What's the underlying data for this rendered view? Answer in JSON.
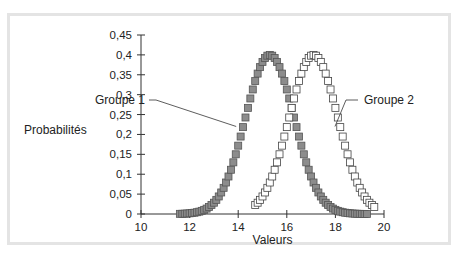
{
  "chart_data": {
    "type": "scatter",
    "title": "",
    "xlabel": "Valeurs",
    "ylabel": "Probabilités",
    "xlim": [
      10,
      20
    ],
    "ylim": [
      0,
      0.45
    ],
    "x_ticks": [
      "10",
      "12",
      "14",
      "16",
      "18",
      "20"
    ],
    "y_ticks": [
      "0",
      "0,05",
      "0,1",
      "0,15",
      "0,2",
      "0,25",
      "0,3",
      "0,35",
      "0,4",
      "0,45"
    ],
    "grid": false,
    "legend": "inline annotations",
    "series": [
      {
        "name": "Groupe 1",
        "marker": "filled-square",
        "color": "#8a8a8a",
        "peak_x": 15.3,
        "peak_y": 0.4,
        "x_range": [
          11.6,
          19.3
        ],
        "points": [
          [
            11.6,
            0.002
          ],
          [
            12.0,
            0.006
          ],
          [
            12.4,
            0.016
          ],
          [
            12.8,
            0.04
          ],
          [
            13.2,
            0.085
          ],
          [
            13.6,
            0.15
          ],
          [
            14.0,
            0.22
          ],
          [
            14.4,
            0.29
          ],
          [
            14.8,
            0.36
          ],
          [
            15.3,
            0.4
          ],
          [
            15.8,
            0.36
          ],
          [
            16.2,
            0.3
          ],
          [
            16.6,
            0.22
          ],
          [
            17.0,
            0.15
          ],
          [
            17.4,
            0.09
          ],
          [
            17.8,
            0.05
          ],
          [
            18.2,
            0.025
          ],
          [
            18.6,
            0.01
          ],
          [
            19.0,
            0.004
          ],
          [
            19.3,
            0.002
          ]
        ]
      },
      {
        "name": "Groupe 2",
        "marker": "open-square",
        "color": "#ffffff",
        "peak_x": 17.1,
        "peak_y": 0.4,
        "x_range": [
          14.7,
          19.6
        ],
        "points": [
          [
            14.7,
            0.002
          ],
          [
            15.1,
            0.012
          ],
          [
            15.5,
            0.04
          ],
          [
            15.9,
            0.11
          ],
          [
            16.3,
            0.22
          ],
          [
            16.7,
            0.34
          ],
          [
            17.1,
            0.4
          ],
          [
            17.5,
            0.34
          ],
          [
            17.9,
            0.23
          ],
          [
            18.3,
            0.13
          ],
          [
            18.7,
            0.06
          ],
          [
            19.1,
            0.02
          ],
          [
            19.6,
            0.004
          ]
        ]
      }
    ],
    "annotations": [
      {
        "text": "Groupe 1",
        "points_to": [
          14.0,
          0.22
        ]
      },
      {
        "text": "Groupe 2",
        "points_to": [
          17.9,
          0.22
        ]
      }
    ]
  }
}
